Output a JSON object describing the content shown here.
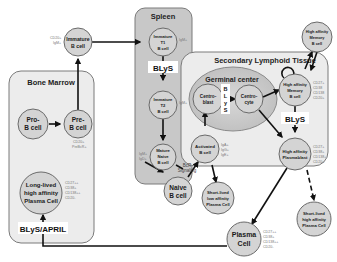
{
  "regions": {
    "bone_marrow": {
      "title": "Bone Marrow"
    },
    "spleen": {
      "title": "Spleen"
    },
    "secondary_lymphoid": {
      "title": "Secondary Lymphoid Tissue"
    },
    "germinal_center": {
      "title": "Germinal center"
    }
  },
  "cells": {
    "pro_b": {
      "line1": "Pro-",
      "line2": "B cell"
    },
    "pre_b": {
      "line1": "Pre-",
      "line2": "B cell",
      "markers": [
        "CD20+",
        "PreBcR+"
      ]
    },
    "immature_b": {
      "line1": "Immature",
      "line2": "B cell",
      "markers": [
        "CD20+",
        "IgM+"
      ]
    },
    "immature_t1": {
      "line1": "Immature",
      "line2": "T1",
      "line3": "B cell",
      "markers": [
        "IgM+"
      ]
    },
    "immature_t2": {
      "line1": "Immature",
      "line2": "T2",
      "line3": "B cell",
      "markers": [
        "IgM+"
      ]
    },
    "mature_naive": {
      "line1": "Mature",
      "line2": "Naive",
      "line3": "B cell",
      "markers": [
        "IgM+",
        "IgD+"
      ]
    },
    "naive_b": {
      "line1": "Naive",
      "line2": "B cell"
    },
    "activated_b": {
      "line1": "Activated",
      "line2": "B cell",
      "markers": [
        "IgA+",
        "IgG+",
        "IgE+"
      ]
    },
    "centroblast": {
      "line1": "Centro-",
      "line2": "blast"
    },
    "centrocyte": {
      "line1": "Centro-",
      "line2": "cyte"
    },
    "ha_memory_inner": {
      "line1": "High affinity",
      "line2": "Memory",
      "line3": "B cell",
      "markers": [
        "CD27+",
        "CD38",
        "CD138",
        "CD20+"
      ]
    },
    "ha_memory_outer": {
      "line1": "High affinity",
      "line2": "Memory",
      "line3": "B cell"
    },
    "ha_plasmablast": {
      "line1": "High affinity",
      "line2": "Plasmablast",
      "markers": [
        "CD27+",
        "CD38+",
        "CD138+",
        "CD20+"
      ]
    },
    "sl_low_pc": {
      "line1": "Short-lived",
      "line2": "low affinity",
      "line3": "Plasma Cell"
    },
    "sl_high_pc": {
      "line1": "Short-lived",
      "line2": "high affinity",
      "line3": "Plasma Cell"
    },
    "plasma_cell": {
      "line1": "Plasma",
      "line2": "Cell",
      "markers": [
        "CD27++",
        "CD38+",
        "CD138++",
        "CD20-"
      ]
    },
    "long_lived_pc": {
      "line1": "Long-lived",
      "line2": "high affinity",
      "line3": "Plasma Cell",
      "markers": [
        "CD27++",
        "CD38+",
        "CD138++",
        "CD20-"
      ]
    }
  },
  "signals": {
    "blys_spleen": "BLyS",
    "blys_gc": [
      "B",
      "L",
      "y",
      "S"
    ],
    "blys_slt": "BLyS",
    "blys_april": "BLyS/APRIL",
    "bcr_signaling": {
      "line1": "BcR",
      "line2": "Signaling"
    }
  },
  "colors": {
    "region_fill": "#ececec",
    "spleen_fill": "#c8c8c8",
    "germinal_fill": "#c2c2c2",
    "cell_fill": "#d4d4d4",
    "arrow": "#111111"
  }
}
